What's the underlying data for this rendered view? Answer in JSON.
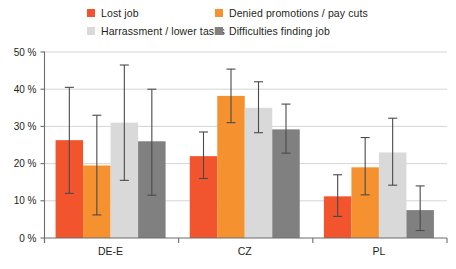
{
  "legend": {
    "items": [
      {
        "label": "Lost job",
        "color": "#f2542d",
        "swatch": "legend-swatch-lost-job"
      },
      {
        "label": "Denied promotions / pay cuts",
        "color": "#f5922f",
        "swatch": "legend-swatch-denied-promotions"
      },
      {
        "label": "Harrassment / lower tasks",
        "color": "#d9d9d9",
        "swatch": "legend-swatch-harrassment"
      },
      {
        "label": "Difficulties finding job",
        "color": "#808080",
        "swatch": "legend-swatch-difficulties"
      }
    ]
  },
  "axis": {
    "y_ticks": [
      "0 %",
      "10 %",
      "20 %",
      "30 %",
      "40 %",
      "50 %"
    ],
    "x_ticks": [
      "DE-E",
      "CZ",
      "PL"
    ]
  },
  "chart_data": {
    "type": "bar",
    "title": "",
    "subtitle": "",
    "xlabel": "",
    "ylabel": "",
    "ylim": [
      0,
      50
    ],
    "yunit": "%",
    "ytick_values": [
      0,
      10,
      20,
      30,
      40,
      50
    ],
    "grid": true,
    "legend_position": "top",
    "error_bars": true,
    "categories": [
      "DE-E",
      "CZ",
      "PL"
    ],
    "series": [
      {
        "name": "Lost job",
        "color": "#f2542d",
        "values": [
          26.3,
          22.0,
          11.2
        ],
        "err_low": [
          12.0,
          16.0,
          5.8
        ],
        "err_high": [
          40.5,
          28.5,
          17.0
        ]
      },
      {
        "name": "Denied promotions / pay cuts",
        "color": "#f5922f",
        "values": [
          19.5,
          38.2,
          19.0
        ],
        "err_low": [
          6.2,
          31.0,
          11.6
        ],
        "err_high": [
          33.0,
          45.4,
          27.0
        ]
      },
      {
        "name": "Harrassment / lower tasks",
        "color": "#d9d9d9",
        "values": [
          31.0,
          35.0,
          23.0
        ],
        "err_low": [
          15.5,
          28.3,
          14.2
        ],
        "err_high": [
          46.5,
          42.0,
          32.2
        ]
      },
      {
        "name": "Difficulties finding job",
        "color": "#808080",
        "values": [
          26.0,
          29.2,
          7.5
        ],
        "err_low": [
          11.5,
          22.8,
          2.0
        ],
        "err_high": [
          40.0,
          36.0,
          14.0
        ]
      }
    ]
  }
}
